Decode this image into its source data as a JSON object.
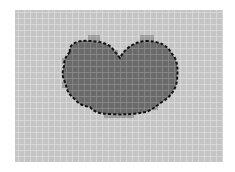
{
  "diagram": {
    "type": "grid-segmentation",
    "canvas": {
      "width": 235,
      "height": 172
    },
    "grid": {
      "x": 15,
      "y": 10,
      "width": 208,
      "height": 152,
      "cell_size": 6,
      "fill": "#c4c4c4",
      "line_color": "#dcdcdc"
    },
    "region": {
      "label": "segmented-blob",
      "fill": "#6a6a6a",
      "outline_color": "#111111",
      "outline_style": "dashed",
      "path": "M70,52 C68,44 78,40 88,41 C96,41 106,42 112,48 L120,58 C124,50 132,42 146,41 C160,41 168,46 172,54 C178,60 178,70 177,80 C176,90 170,97 162,102 C156,106 152,110 146,112 C136,114 124,115 110,114 C100,114 94,112 90,107 C84,106 78,104 76,100 C70,96 66,90 66,84 C62,78 62,72 64,66 C64,60 66,56 70,52 Z"
    },
    "halo_cells": [
      {
        "x": 88,
        "y": 35,
        "w": 12,
        "h": 6
      },
      {
        "x": 140,
        "y": 35,
        "w": 14,
        "h": 6
      },
      {
        "x": 112,
        "y": 50,
        "w": 6,
        "h": 6
      },
      {
        "x": 62,
        "y": 58,
        "w": 6,
        "h": 6
      },
      {
        "x": 62,
        "y": 82,
        "w": 6,
        "h": 6
      },
      {
        "x": 150,
        "y": 104,
        "w": 8,
        "h": 6
      },
      {
        "x": 104,
        "y": 112,
        "w": 30,
        "h": 6
      }
    ],
    "halo_fill": "#9a9a9a"
  }
}
